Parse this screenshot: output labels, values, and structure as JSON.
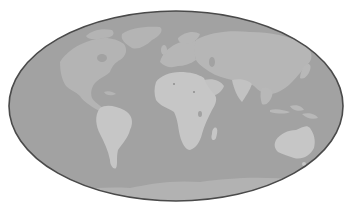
{
  "map": {
    "projection": "elliptical (Mollweide-like) world map",
    "colors": {
      "background": "#ffffff",
      "ocean": "#a2a2a2",
      "land_north": "#b6b6b6",
      "land_south": "#c6c6c6",
      "antarctica": "#b2b2b2",
      "border": "#4a4a4a",
      "lake": "#a2a2a2"
    },
    "regions": [
      {
        "name": "North America"
      },
      {
        "name": "Greenland"
      },
      {
        "name": "South America"
      },
      {
        "name": "Europe"
      },
      {
        "name": "Asia"
      },
      {
        "name": "Africa"
      },
      {
        "name": "Arabian Peninsula"
      },
      {
        "name": "India"
      },
      {
        "name": "Southeast Asia"
      },
      {
        "name": "Indonesia"
      },
      {
        "name": "Australia"
      },
      {
        "name": "Madagascar"
      },
      {
        "name": "Japan"
      },
      {
        "name": "Antarctica"
      }
    ]
  }
}
